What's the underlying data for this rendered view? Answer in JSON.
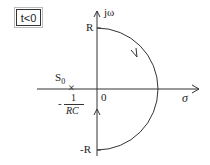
{
  "condition_label": "t<0",
  "axes": {
    "imag_label": "jω",
    "real_label": "σ",
    "origin_label": "0",
    "top_label": "R",
    "bottom_label": "-R"
  },
  "pole": {
    "name": "S",
    "subscript": "0",
    "marker": "×",
    "value_sign": "-",
    "value_numerator": "1",
    "value_denominator": "RC"
  },
  "contour": {
    "type": "semicircle-right",
    "direction": "clockwise",
    "radius_label": "R"
  },
  "colors": {
    "line": "#333333",
    "background": "#ffffff"
  }
}
